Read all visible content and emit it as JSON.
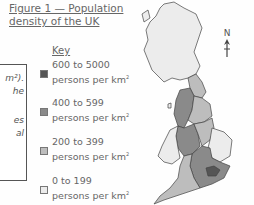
{
  "figure": {
    "title_line1": "Figure 1 — Population",
    "title_line2": "density of the UK"
  },
  "textbox": {
    "fragments": [
      "m²).",
      "he",
      "",
      "es",
      "al"
    ]
  },
  "key": {
    "title": "Key",
    "items": [
      {
        "range": "600 to 5000",
        "unit": "persons per km",
        "sup": "2",
        "color": "#555555"
      },
      {
        "range": "400 to 599",
        "unit": "persons per km",
        "sup": "2",
        "color": "#8a8a8a"
      },
      {
        "range": "200 to 399",
        "unit": "persons per km",
        "sup": "2",
        "color": "#bdbdbd"
      },
      {
        "range": "0 to 199",
        "unit": "persons per km",
        "sup": "2",
        "color": "#ebebeb"
      }
    ]
  },
  "compass": {
    "label": "N"
  }
}
